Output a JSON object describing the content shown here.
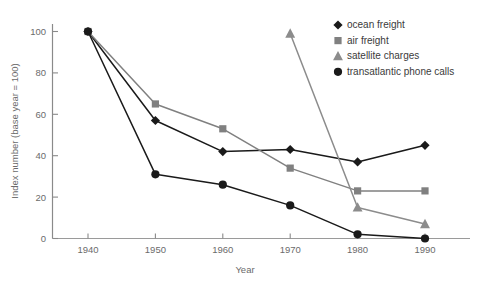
{
  "chart_data": {
    "type": "line",
    "title": "",
    "subtitle": "",
    "xlabel": "Year",
    "ylabel": "Index number (base year = 100)",
    "x": [
      1940,
      1950,
      1960,
      1970,
      1980,
      1990
    ],
    "xticklabels": [
      "1940",
      "1950",
      "1960",
      "1970",
      "1980",
      "1990"
    ],
    "yticks": [
      0,
      20,
      40,
      60,
      80,
      100
    ],
    "yticklabels": [
      "0",
      "20",
      "40",
      "60",
      "80",
      "100"
    ],
    "xlim": [
      1935,
      1995
    ],
    "ylim": [
      0,
      108
    ],
    "grid": false,
    "legend_position": "top-right",
    "series": [
      {
        "name": "ocean freight",
        "marker": "diamond",
        "color": "#1a1a1a",
        "x": [
          1940,
          1950,
          1960,
          1970,
          1980,
          1990
        ],
        "values": [
          100,
          57,
          42,
          43,
          37,
          45
        ]
      },
      {
        "name": "air freight",
        "marker": "square",
        "color": "#808080",
        "x": [
          1940,
          1950,
          1960,
          1970,
          1980,
          1990
        ],
        "values": [
          100,
          65,
          53,
          34,
          23,
          23
        ]
      },
      {
        "name": "satellite charges",
        "marker": "triangle",
        "color": "#8c8c8c",
        "x": [
          1970,
          1980,
          1990
        ],
        "values": [
          99,
          15,
          7
        ]
      },
      {
        "name": "transatlantic phone calls",
        "marker": "circle",
        "color": "#1a1a1a",
        "x": [
          1940,
          1950,
          1960,
          1970,
          1980,
          1990
        ],
        "values": [
          100,
          31,
          26,
          16,
          2,
          0
        ]
      }
    ]
  },
  "axes": {
    "y_title": "Index number (base year = 100)",
    "x_title": "Year",
    "y_tick_0": "0",
    "y_tick_1": "20",
    "y_tick_2": "40",
    "y_tick_3": "60",
    "y_tick_4": "80",
    "y_tick_5": "100",
    "x_tick_0": "1940",
    "x_tick_1": "1950",
    "x_tick_2": "1960",
    "x_tick_3": "1970",
    "x_tick_4": "1980",
    "x_tick_5": "1990"
  },
  "legend": {
    "entries": [
      {
        "label": "ocean freight",
        "marker": "diamond-marker-icon",
        "color": "#1a1a1a"
      },
      {
        "label": "air freight",
        "marker": "square-marker-icon",
        "color": "#808080"
      },
      {
        "label": "satellite charges",
        "marker": "triangle-marker-icon",
        "color": "#8c8c8c"
      },
      {
        "label": "transatlantic phone calls",
        "marker": "circle-marker-icon",
        "color": "#1a1a1a"
      }
    ]
  },
  "colors": {
    "dark": "#1a1a1a",
    "gray": "#808080",
    "gray_light": "#8c8c8c",
    "axis": "#8a8a8a",
    "text": "#6b6b6b",
    "background": "#ffffff"
  }
}
